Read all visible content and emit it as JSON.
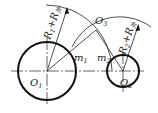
{
  "diagram": {
    "type": "tangent-arc construction (external tangency)",
    "stroke_color": "#111111",
    "background": "#ffffff",
    "circles": [
      {
        "id": "circle-1",
        "center_label": "O",
        "center_sub": "1",
        "cx": 47,
        "cy": 71,
        "r": 29
      },
      {
        "id": "circle-2",
        "center_label": "O",
        "center_sub": "2",
        "cx": 123,
        "cy": 71,
        "r": 16
      }
    ],
    "points": {
      "o3": {
        "label": "O",
        "sub": "3"
      },
      "m1": {
        "label": "m",
        "sub": "1"
      },
      "m2": {
        "label": "m",
        "sub": "2"
      }
    },
    "radius_labels": {
      "r1": {
        "main": "R",
        "sub1": "1",
        "plus": "+",
        "main2": "R",
        "sub2": "外"
      },
      "r2": {
        "main": "R",
        "sub1": "2",
        "plus": "+",
        "main2": "R",
        "sub2": "外"
      }
    }
  }
}
